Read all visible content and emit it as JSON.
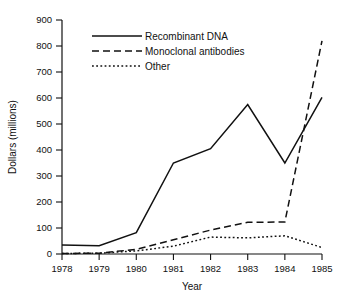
{
  "chart_data": {
    "type": "line",
    "title": "",
    "xlabel": "Year",
    "ylabel": "Dollars (millions)",
    "x": [
      1978,
      1979,
      1980,
      1981,
      1982,
      1983,
      1984,
      1985
    ],
    "categories": [
      "1978",
      "1979",
      "1980",
      "1981",
      "1982",
      "1983",
      "1984",
      "1985"
    ],
    "xlim": [
      1978,
      1985
    ],
    "ylim": [
      0,
      900
    ],
    "yticks": [
      0,
      100,
      200,
      300,
      400,
      500,
      600,
      700,
      800,
      900
    ],
    "ytick_labels": [
      "0",
      "100",
      "200",
      "300",
      "400",
      "500",
      "600",
      "700",
      "800",
      "900"
    ],
    "xtick_labels": [
      "1978",
      "1979",
      "1980",
      "1981",
      "1982",
      "1983",
      "1984",
      "1985"
    ],
    "grid": false,
    "legend_position": "top-center",
    "series": [
      {
        "name": "Recombinant DNA",
        "style": "solid",
        "color": "#111111",
        "values": [
          35,
          32,
          82,
          350,
          405,
          575,
          350,
          602
        ]
      },
      {
        "name": "Monoclonal antibodies",
        "style": "dashed",
        "color": "#111111",
        "values": [
          2,
          3,
          18,
          55,
          92,
          122,
          123,
          820
        ]
      },
      {
        "name": "Other",
        "style": "dotted",
        "color": "#111111",
        "values": [
          2,
          3,
          12,
          30,
          65,
          62,
          70,
          25
        ]
      }
    ]
  },
  "axes": {
    "y_title": "Dollars (millions)",
    "x_title": "Year"
  },
  "legend": {
    "entries": [
      {
        "label": "Recombinant DNA",
        "style": "solid"
      },
      {
        "label": "Monoclonal antibodies",
        "style": "dashed"
      },
      {
        "label": "Other",
        "style": "dotted"
      }
    ]
  }
}
